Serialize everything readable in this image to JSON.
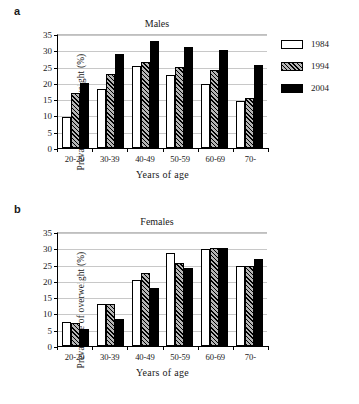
{
  "figure": {
    "panels": [
      {
        "letter": "a",
        "title": "Males",
        "ylabel": "Prevalence of overweight (%)",
        "xlabel": "Years of age"
      },
      {
        "letter": "b",
        "title": "Females",
        "ylabel": "Prevalence of overweight (%)",
        "xlabel": "Years of age"
      }
    ],
    "legend": {
      "items": [
        {
          "label": "1984",
          "swatch": "white-outline-swatch"
        },
        {
          "label": "1994",
          "swatch": "hatched-swatch"
        },
        {
          "label": "2004",
          "swatch": "black-swatch"
        }
      ]
    },
    "yticks": [
      "0",
      "5",
      "10",
      "15",
      "20",
      "25",
      "30",
      "35"
    ]
  },
  "chart_data": [
    {
      "type": "bar",
      "title": "Males",
      "panel": "a",
      "xlabel": "Years of age",
      "ylabel": "Prevalence of overweight (%)",
      "categories": [
        "20-29",
        "30-39",
        "40-49",
        "50-59",
        "60-69",
        "70-"
      ],
      "series": [
        {
          "name": "1984",
          "values": [
            9.5,
            18.0,
            25.3,
            22.3,
            19.8,
            14.3
          ]
        },
        {
          "name": "1994",
          "values": [
            17.0,
            22.8,
            26.4,
            24.8,
            24.0,
            15.4
          ]
        },
        {
          "name": "2004",
          "values": [
            20.0,
            29.0,
            33.0,
            31.0,
            30.0,
            25.5
          ]
        }
      ],
      "ylim": [
        0,
        35
      ],
      "ytick_step": 5,
      "grid": true,
      "legend_position": "right"
    },
    {
      "type": "bar",
      "title": "Females",
      "panel": "b",
      "xlabel": "Years of age",
      "ylabel": "Prevalence of overweight (%)",
      "categories": [
        "20-29",
        "30-39",
        "40-49",
        "50-59",
        "60-69",
        "70-"
      ],
      "series": [
        {
          "name": "1984",
          "values": [
            7.5,
            13.0,
            20.3,
            28.5,
            29.7,
            24.5
          ]
        },
        {
          "name": "1994",
          "values": [
            7.2,
            13.0,
            22.3,
            25.5,
            30.2,
            24.6
          ]
        },
        {
          "name": "2004",
          "values": [
            5.3,
            8.2,
            17.9,
            24.1,
            30.0,
            26.8
          ]
        }
      ],
      "ylim": [
        0,
        35
      ],
      "ytick_step": 5,
      "grid": true,
      "legend_position": "none"
    }
  ]
}
